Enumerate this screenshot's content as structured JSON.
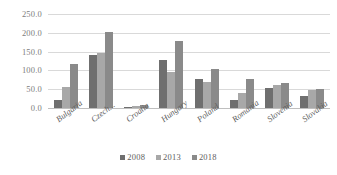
{
  "chart_data": {
    "type": "bar",
    "title": "",
    "xlabel": "",
    "ylabel": "",
    "ylim": [
      0,
      250
    ],
    "ytick_step": 50,
    "ytick_labels": [
      "0.0",
      "50.0",
      "100.0",
      "150.0",
      "200.0",
      "250.0"
    ],
    "grid": true,
    "legend_position": "bottom",
    "categories": [
      "Bulgaria",
      "Czech...",
      "Croatia",
      "Hungary",
      "Poland",
      "Romania",
      "Slovenia",
      "Slovakia"
    ],
    "series": [
      {
        "name": "2008",
        "color": "#6f6f6f",
        "values": [
          20,
          142,
          4,
          128,
          77,
          22,
          52,
          32
        ]
      },
      {
        "name": "2013",
        "color": "#a8a8a8",
        "values": [
          55,
          145,
          6,
          95,
          68,
          40,
          60,
          47
        ]
      },
      {
        "name": "2018",
        "color": "#8a8a8a",
        "values": [
          118,
          203,
          8,
          178,
          105,
          78,
          67,
          50
        ]
      }
    ]
  },
  "colors": {
    "gridline": "#d9d9d9",
    "axis": "#bfbfbf",
    "tick_text": "#7d7d7d",
    "label_text": "#5e5e5e",
    "background": "#ffffff"
  }
}
